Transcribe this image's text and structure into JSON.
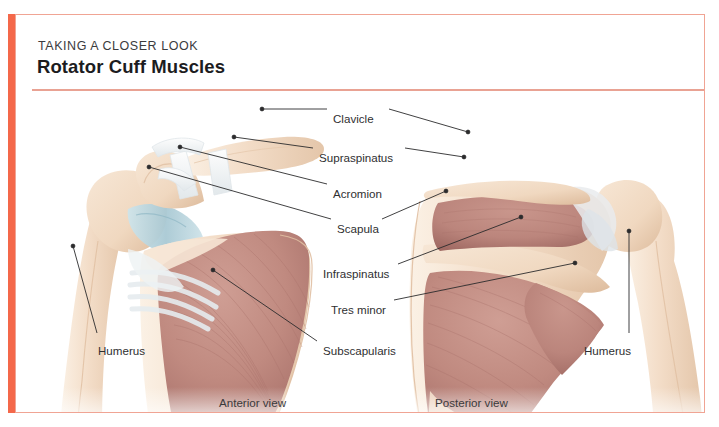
{
  "card": {
    "kicker": "TAKING A CLOSER LOOK",
    "title": "Rotator Cuff Muscles",
    "accent_color": "#f4684a",
    "rule_color": "#e9a293",
    "border_color": "#f0a494",
    "background_color": "#ffffff"
  },
  "palette": {
    "bone": "#f3ddc8",
    "bone_shadow": "#e3c3a6",
    "bone_light": "#faeee0",
    "muscle": "#c08a80",
    "muscle_dark": "#a86e66",
    "muscle_light": "#d3a79d",
    "cartilage": "#b6d3dc",
    "ligament": "#f0f2f3",
    "ligament_shadow": "#dfe4e7",
    "leader_line": "#2b2b2d",
    "text": "#2f2f31"
  },
  "figures": [
    {
      "id": "anterior",
      "caption": "Anterior view"
    },
    {
      "id": "posterior",
      "caption": "Posterior view"
    }
  ],
  "captions": {
    "anterior": "Anterior view",
    "posterior": "Posterior view"
  },
  "labels": {
    "clavicle": "Clavicle",
    "supraspinatus": "Supraspinatus",
    "acromion": "Acromion",
    "scapula": "Scapula",
    "infraspinatus": "Infraspinatus",
    "teres_minor": "Tres minor",
    "subscapularis": "Subscapularis",
    "humerus_left": "Humerus",
    "humerus_right": "Humerus"
  },
  "annotations": [
    {
      "name": "clavicle",
      "text": "Clavicle",
      "label_x": 332,
      "label_y": 103,
      "leaders": [
        {
          "side": "left",
          "from": [
            326,
            108
          ],
          "to": [
            261,
            108
          ],
          "dot": [
            261,
            108
          ]
        },
        {
          "side": "right",
          "from": [
            388,
            108
          ],
          "to": [
            455,
            148
          ],
          "dot": [
            455,
            148
          ]
        }
      ]
    },
    {
      "name": "supraspinatus",
      "text": "Supraspinatus",
      "label_x": 318,
      "label_y": 142,
      "leaders": [
        {
          "side": "left",
          "from": [
            312,
            147
          ],
          "to": [
            232,
            136
          ],
          "dot": [
            232,
            136
          ]
        },
        {
          "side": "right",
          "from": [
            404,
            147
          ],
          "to": [
            461,
            153
          ],
          "dot": [
            461,
            153
          ]
        }
      ]
    },
    {
      "name": "acromion",
      "text": "Acromion",
      "label_x": 332,
      "label_y": 178,
      "leaders": [
        {
          "side": "left",
          "from": [
            326,
            183
          ],
          "to": [
            178,
            146
          ],
          "dot": [
            178,
            146
          ]
        }
      ]
    },
    {
      "name": "scapula",
      "text": "Scapula",
      "label_x": 336,
      "label_y": 213,
      "leaders": [
        {
          "side": "left",
          "from": [
            330,
            218
          ],
          "to": [
            147,
            166
          ],
          "dot": [
            147,
            166
          ]
        },
        {
          "side": "right",
          "from": [
            381,
            218
          ],
          "to": [
            444,
            190
          ],
          "dot": [
            444,
            190
          ]
        }
      ]
    },
    {
      "name": "infraspinatus",
      "text": "Infraspinatus",
      "label_x": 322,
      "label_y": 258,
      "leaders": [
        {
          "side": "right",
          "from": [
            397,
            263
          ],
          "to": [
            519,
            216
          ],
          "dot": [
            519,
            216
          ]
        }
      ]
    },
    {
      "name": "teres-minor",
      "text": "Tres minor",
      "label_x": 330,
      "label_y": 294,
      "leaders": [
        {
          "side": "right",
          "from": [
            393,
            299
          ],
          "to": [
            573,
            262
          ],
          "dot": [
            573,
            262
          ]
        }
      ]
    },
    {
      "name": "subscapularis",
      "text": "Subscapularis",
      "label_x": 322,
      "label_y": 335,
      "leaders": [
        {
          "side": "left",
          "from": [
            316,
            340
          ],
          "to": [
            212,
            269
          ],
          "dot": [
            212,
            269
          ]
        }
      ]
    },
    {
      "name": "humerus-left",
      "text": "Humerus",
      "label_x": 97,
      "label_y": 335,
      "leaders": [
        {
          "side": "up",
          "from": [
            96,
            331
          ],
          "to": [
            72,
            245
          ],
          "dot": [
            72,
            245
          ]
        }
      ]
    },
    {
      "name": "humerus-right",
      "text": "Humerus",
      "label_x": 583,
      "label_y": 335,
      "leaders": [
        {
          "side": "up",
          "from": [
            628,
            331
          ],
          "to": [
            628,
            230
          ],
          "dot": [
            628,
            230
          ]
        }
      ]
    }
  ]
}
